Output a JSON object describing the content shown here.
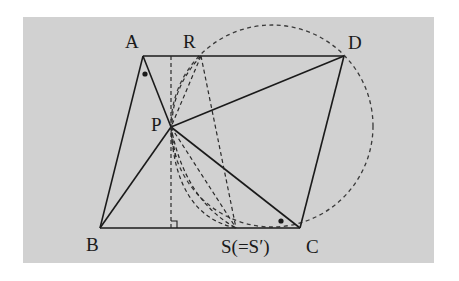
{
  "diagram": {
    "type": "geometry",
    "background_color": "#d1d1d1",
    "labels": {
      "A": "A",
      "R": "R",
      "D": "D",
      "P": "P",
      "B": "B",
      "S": "S(=S′)",
      "C": "C"
    },
    "points": {
      "A": [
        143,
        56
      ],
      "D": [
        344,
        56
      ],
      "B": [
        100,
        228
      ],
      "C": [
        300,
        228
      ],
      "P": [
        171,
        127
      ],
      "R": [
        201,
        56
      ],
      "S": [
        236,
        228
      ],
      "H": [
        171,
        228
      ]
    },
    "circle": {
      "center": [
        272,
        126
      ],
      "radius": 100,
      "style": "dashed"
    },
    "angle_marks": [
      "angle-at-A (dot)",
      "angle-at-C (dot)"
    ],
    "right_angle_mark": "at foot of perpendicular from P to BC"
  }
}
